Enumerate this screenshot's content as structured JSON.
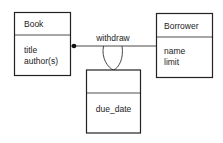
{
  "diagram": {
    "classes": [
      {
        "id": "book",
        "name": "Book",
        "attributes": [
          "title",
          "author(s)"
        ]
      },
      {
        "id": "borrower",
        "name": "Borrower",
        "attributes": [
          "name",
          "limit"
        ]
      },
      {
        "id": "link",
        "name": "",
        "attributes": [
          "due_date"
        ]
      }
    ],
    "association": {
      "label": "withdraw",
      "from": "Book",
      "to": "Borrower",
      "multiplicity_from": "many (filled dot)",
      "link_attribute_class": "due_date"
    }
  }
}
